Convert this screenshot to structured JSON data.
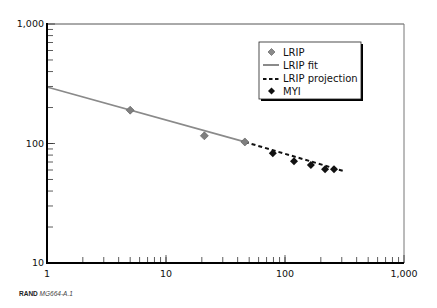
{
  "chart_data": {
    "type": "scatter",
    "title": "",
    "xlabel": "",
    "ylabel": "",
    "x_scale": "log",
    "y_scale": "log",
    "xlim": [
      1,
      1000
    ],
    "ylim": [
      10,
      1000
    ],
    "x_tick_labels": [
      "1",
      "10",
      "100",
      "1,000"
    ],
    "y_tick_labels": [
      "10",
      "100",
      "1,000"
    ],
    "grid": false,
    "legend_position": "upper right",
    "series": [
      {
        "name": "LRIP",
        "type": "scatter",
        "marker": "diamond",
        "color": "#7f7f7f",
        "x": [
          5,
          21,
          46
        ],
        "y": [
          190,
          116,
          103
        ]
      },
      {
        "name": "LRIP fit",
        "type": "line",
        "style": "solid",
        "color": "#8a8a8a",
        "x": [
          1,
          46
        ],
        "y": [
          297,
          103
        ]
      },
      {
        "name": "LRIP projection",
        "type": "line",
        "style": "dashed",
        "color": "#111111",
        "x": [
          46,
          307
        ],
        "y": [
          103,
          59
        ]
      },
      {
        "name": "MYI",
        "type": "scatter",
        "marker": "diamond",
        "color": "#111111",
        "x": [
          79,
          119,
          165,
          217,
          258
        ],
        "y": [
          83,
          71,
          66,
          61,
          61
        ]
      }
    ]
  },
  "legend": {
    "items": [
      {
        "label": "LRIP"
      },
      {
        "label": "LRIP fit"
      },
      {
        "label": "LRIP projection"
      },
      {
        "label": "MYI"
      }
    ]
  },
  "axes": {
    "x_labels": [
      "1",
      "10",
      "100",
      "1,000"
    ],
    "y_labels": [
      "10",
      "100",
      "1,000"
    ]
  },
  "source": {
    "org": "RAND",
    "id": "MG664-A.1"
  }
}
